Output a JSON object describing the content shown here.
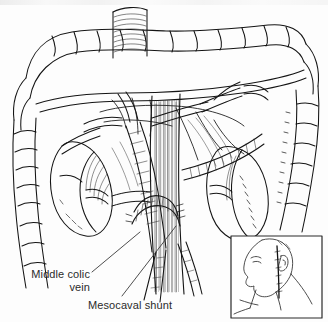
{
  "figure": {
    "title": "Mesocaval shunt",
    "width": 328,
    "height": 322,
    "background_color": "#fdfdfd",
    "ink_color": "#1a1a1a",
    "style": "pen-and-ink line drawing with hatched shading"
  },
  "labels": [
    {
      "id": "middle-colic-vein",
      "line1": "Middle colic",
      "line2": "vein",
      "x": 12,
      "y": 268,
      "align": "right",
      "color": "#2b2b2b",
      "leader": {
        "x1": 92,
        "y1": 272,
        "x2": 140,
        "y2": 232
      }
    },
    {
      "id": "mesocaval-shunt",
      "line1": "Mesocaval shunt",
      "line2": "",
      "x": 88,
      "y": 299,
      "align": "left",
      "color": "#2b2b2b",
      "leader": {
        "x1": 122,
        "y1": 296,
        "x2": 176,
        "y2": 226
      }
    }
  ],
  "inset": {
    "id": "head-neck-inset",
    "description": "lateral profile of head and neck with vertical incision line",
    "x": 231,
    "y": 236,
    "width": 91,
    "height": 82,
    "border_color": "#2a2a2a",
    "background_color": "#ffffff",
    "incision_line_color": "#111111"
  },
  "structures": [
    {
      "id": "transverse-colon",
      "label": "transverse colon",
      "region": "top"
    },
    {
      "id": "ascending-colon",
      "label": "ascending colon",
      "region": "right"
    },
    {
      "id": "descending-colon",
      "label": "descending colon",
      "region": "left"
    },
    {
      "id": "duodenal-stump",
      "label": "duodenal stump",
      "region": "top-center"
    },
    {
      "id": "inferior-vena-cava",
      "label": "inferior vena cava",
      "region": "center"
    },
    {
      "id": "superior-mesenteric-vein",
      "label": "superior mesenteric vein",
      "region": "center"
    },
    {
      "id": "left-kidney",
      "label": "left kidney",
      "region": "left-center"
    },
    {
      "id": "right-kidney",
      "label": "right kidney",
      "region": "right-center"
    },
    {
      "id": "shunt-graft",
      "label": "shunt graft",
      "region": "center-lower"
    },
    {
      "id": "small-bowel-mesentery",
      "label": "small bowel mesentery",
      "region": "center"
    }
  ]
}
